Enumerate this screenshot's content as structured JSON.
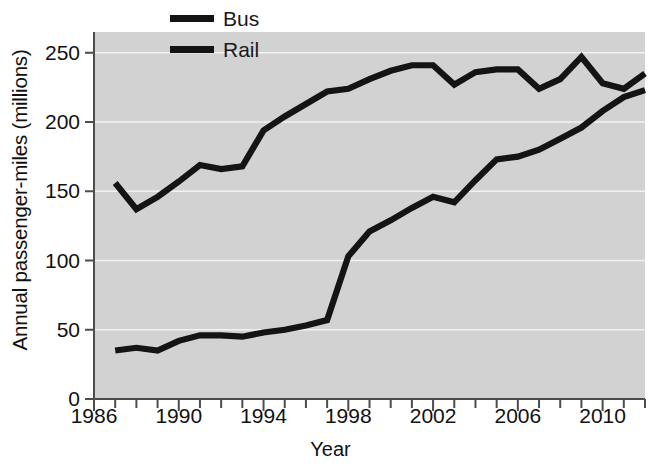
{
  "chart_data": {
    "type": "line",
    "title": "",
    "xlabel": "Year",
    "ylabel": "Annual passenger-miles (millions)",
    "xlim": [
      1986,
      2012
    ],
    "ylim": [
      0,
      265
    ],
    "yticks": [
      0,
      50,
      100,
      150,
      200,
      250
    ],
    "xticks": [
      1986,
      1990,
      1994,
      1998,
      2002,
      2006,
      2010
    ],
    "xtick_labels": [
      "1986",
      "1990",
      "1994",
      "1998",
      "2002",
      "2006",
      "2010"
    ],
    "ytick_labels": [
      "0",
      "50",
      "100",
      "150",
      "200",
      "250"
    ],
    "x_minor_tick_step": 1,
    "grid": "horizontal-white-gridlines",
    "legend_position": "top-center",
    "plot_bg": "#d2d2d2",
    "figure_bg": "#ffffff",
    "gridline_color": "#f2f2f2",
    "axis_color": "#4d4d4d",
    "line_color": "#141414",
    "x": [
      1987,
      1988,
      1989,
      1990,
      1991,
      1992,
      1993,
      1994,
      1995,
      1996,
      1997,
      1998,
      1999,
      2000,
      2001,
      2002,
      2003,
      2004,
      2005,
      2006,
      2007,
      2008,
      2009,
      2010,
      2011,
      2012
    ],
    "series": [
      {
        "name": "Bus",
        "color": "#141414",
        "values": [
          156,
          137,
          146,
          157,
          169,
          166,
          168,
          194,
          204,
          213,
          222,
          224,
          231,
          237,
          241,
          241,
          227,
          236,
          238,
          238,
          224,
          231,
          247,
          228,
          224,
          235
        ]
      },
      {
        "name": "Rail",
        "color": "#141414",
        "values": [
          35,
          37,
          35,
          42,
          46,
          46,
          45,
          48,
          50,
          53,
          57,
          103,
          121,
          129,
          138,
          146,
          142,
          158,
          173,
          175,
          180,
          188,
          196,
          208,
          218,
          223
        ]
      }
    ]
  },
  "legend": {
    "items": [
      {
        "label": "Bus"
      },
      {
        "label": "Rail"
      }
    ]
  }
}
